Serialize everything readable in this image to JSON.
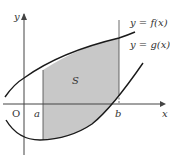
{
  "figure": {
    "axes": {
      "x_label": "x",
      "y_label": "y",
      "origin_label": "O"
    },
    "curves": [
      {
        "name": "f",
        "label": "y = f(x)"
      },
      {
        "name": "g",
        "label": "y = g(x)"
      }
    ],
    "bounds": {
      "left": "a",
      "right": "b"
    },
    "region": {
      "label": "S",
      "fill": "#c8c8c8"
    },
    "colors": {
      "stroke": "#1a1a1a",
      "axis": "#444444",
      "shade": "#c8c8c8"
    }
  }
}
